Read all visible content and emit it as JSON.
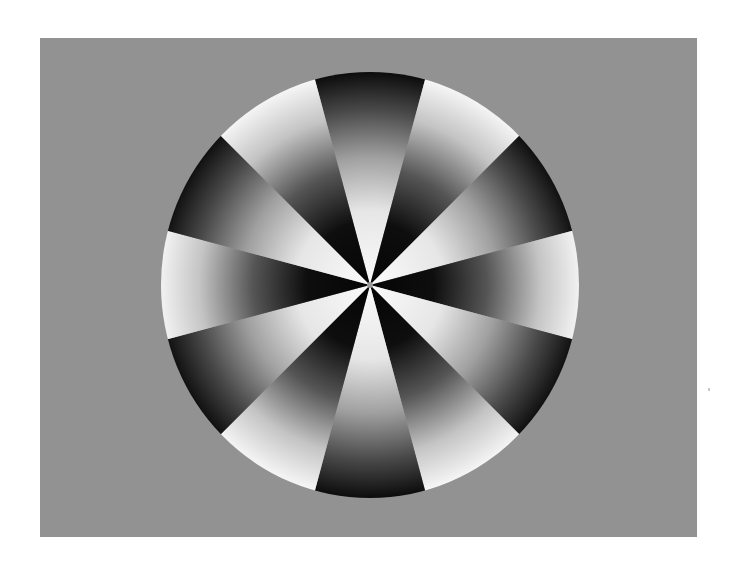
{
  "figure": {
    "description": "Radial sector pattern: 12 alternating gradient wedges inside a circle on a gray panel",
    "canvas": {
      "width": 735,
      "height": 564,
      "background": "#ffffff"
    },
    "panel": {
      "x": 40,
      "y": 38,
      "width": 657,
      "height": 499,
      "color": "#929292"
    },
    "circle": {
      "cx": 370,
      "cy": 285,
      "rx": 209,
      "ry": 213
    },
    "wedge_count": 12,
    "wedge_angle_deg": 30,
    "first_wedge_center_deg": 0,
    "wedge_types": [
      "dark-rim",
      "bright-rim",
      "dark-rim",
      "bright-rim",
      "dark-rim",
      "bright-rim",
      "dark-rim",
      "bright-rim",
      "dark-rim",
      "bright-rim",
      "dark-rim",
      "bright-rim"
    ],
    "colors": {
      "light": "#f4f4f4",
      "mid": "#8c8c8c",
      "dark": "#0c0c0c"
    }
  }
}
